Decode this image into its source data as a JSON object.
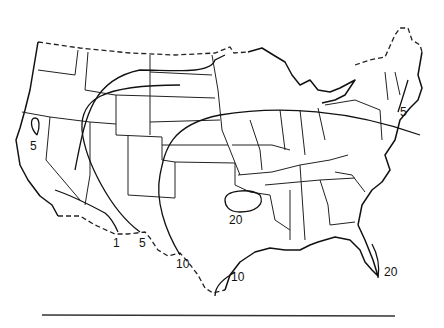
{
  "map": {
    "region": "Contiguous United States",
    "style": "black-and-white isoline map with state boundaries",
    "colors": {
      "line": "#111111",
      "background": "#ffffff"
    },
    "isoline_labels": [
      {
        "id": "ca-5",
        "text": "5",
        "x": 6,
        "y": 151
      },
      {
        "id": "sw-1",
        "text": "1",
        "x": 113,
        "y": 247
      },
      {
        "id": "sw-5",
        "text": "5",
        "x": 139,
        "y": 247
      },
      {
        "id": "tx-10-west",
        "text": "10",
        "x": 176,
        "y": 268
      },
      {
        "id": "tx-20",
        "text": "20",
        "x": 229,
        "y": 224
      },
      {
        "id": "tx-10-gulf",
        "text": "10",
        "x": 231,
        "y": 281
      },
      {
        "id": "fl-20",
        "text": "20",
        "x": 384,
        "y": 276
      },
      {
        "id": "ne-5",
        "text": "5",
        "x": 400,
        "y": 116
      }
    ]
  }
}
